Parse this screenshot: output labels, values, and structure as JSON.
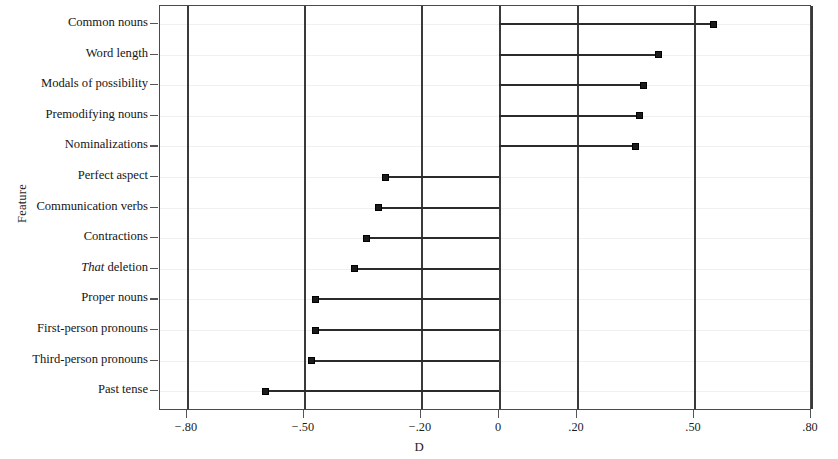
{
  "chart_data": {
    "type": "bar",
    "orientation": "horizontal",
    "style": "lollipop",
    "title": "",
    "xlabel": "D",
    "ylabel": "Feature",
    "xlim": [
      -0.95,
      0.95
    ],
    "grid": "vertical gridlines at each labeled tick",
    "legend": "none",
    "baseline": 0,
    "xticks": [
      -0.8,
      -0.5,
      -0.2,
      0,
      0.2,
      0.5,
      0.8
    ],
    "xticklabels": [
      "−.80",
      "−.50",
      "−.20",
      "0",
      ".20",
      ".50",
      ".80"
    ],
    "categories": [
      "Common nouns",
      "Word length",
      "Modals of possibility",
      "Premodifying nouns",
      "Nominalizations",
      "Perfect aspect",
      "Communication verbs",
      "Contractions",
      "That deletion",
      "Proper nouns",
      "First-person pronouns",
      "Third-person pronouns",
      "Past tense"
    ],
    "values": [
      0.55,
      0.41,
      0.37,
      0.36,
      0.35,
      -0.29,
      -0.31,
      -0.34,
      -0.37,
      -0.47,
      -0.47,
      -0.48,
      -0.6
    ],
    "marker": "filled square",
    "marker_color": "#1b1b1b",
    "line_color": "#2b2b2b"
  },
  "axis": {
    "y_title": "Feature",
    "x_title": "D"
  },
  "rows": [
    {
      "label": "Common nouns",
      "italic_prefix": "",
      "value": 0.55
    },
    {
      "label": "Word length",
      "italic_prefix": "",
      "value": 0.41
    },
    {
      "label": "Modals of possibility",
      "italic_prefix": "",
      "value": 0.37
    },
    {
      "label": "Premodifying nouns",
      "italic_prefix": "",
      "value": 0.36
    },
    {
      "label": "Nominalizations",
      "italic_prefix": "",
      "value": 0.35
    },
    {
      "label": "Perfect aspect",
      "italic_prefix": "",
      "value": -0.29
    },
    {
      "label": "Communication verbs",
      "italic_prefix": "",
      "value": -0.31
    },
    {
      "label": "Contractions",
      "italic_prefix": "",
      "value": -0.34
    },
    {
      "label": " deletion",
      "italic_prefix": "That",
      "value": -0.37
    },
    {
      "label": "Proper nouns",
      "italic_prefix": "",
      "value": -0.47
    },
    {
      "label": "First-person pronouns",
      "italic_prefix": "",
      "value": -0.47
    },
    {
      "label": "Third-person pronouns",
      "italic_prefix": "",
      "value": -0.48
    },
    {
      "label": "Past tense",
      "italic_prefix": "",
      "value": -0.6
    }
  ],
  "colors": {
    "marker": "#1b1b1b",
    "stem": "#2b2b2b",
    "frame": "#4a4a4a",
    "gridline": "#3a3a3a",
    "background": "#ffffff"
  }
}
